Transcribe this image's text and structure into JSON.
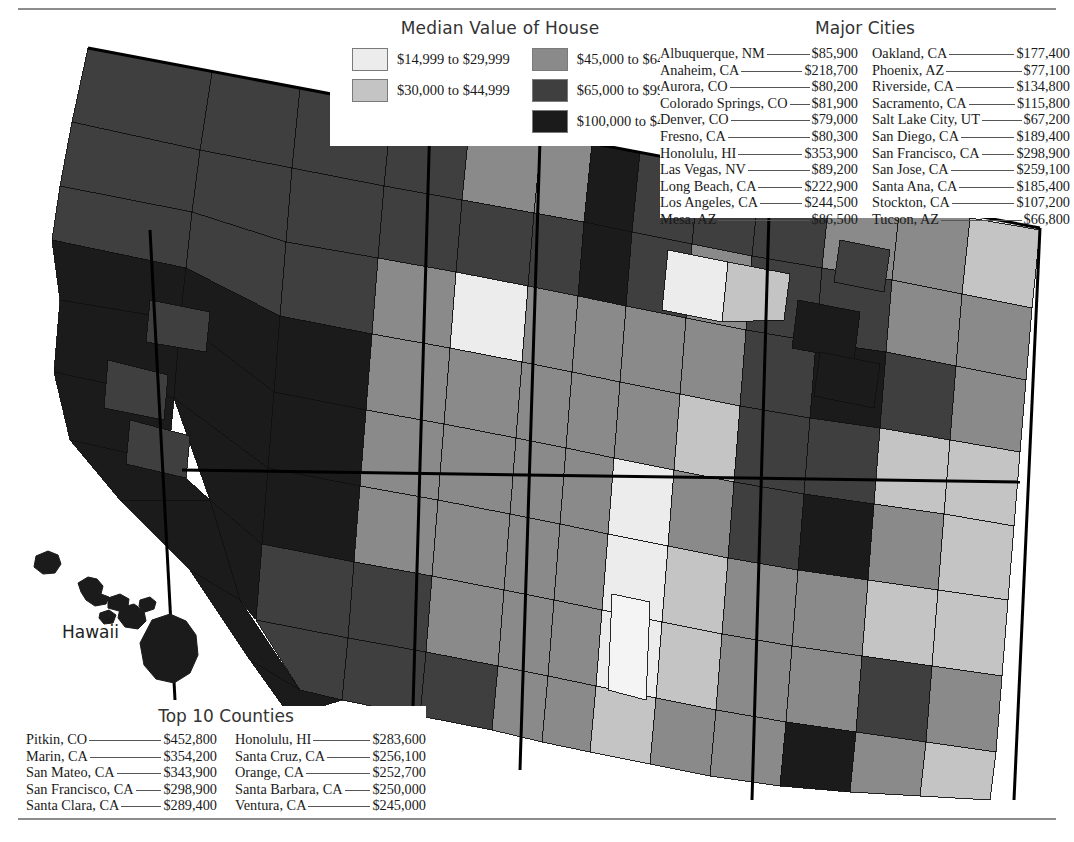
{
  "legend": {
    "title": "Median Value of House",
    "columns": [
      [
        {
          "label": "$14,999 to $29,999",
          "color": "#ececec"
        },
        {
          "label": "$30,000 to $44,999",
          "color": "#c4c4c4"
        }
      ],
      [
        {
          "label": "$45,000 to $64,999",
          "color": "#8a8a8a"
        },
        {
          "label": "$65,000 to $99,999",
          "color": "#3f3f3f"
        },
        {
          "label": "$100,000 to $487,300",
          "color": "#1b1b1b"
        }
      ]
    ]
  },
  "cities": {
    "title": "Major Cities",
    "columns": [
      [
        {
          "name": "Albuquerque, NM",
          "value": "$85,900"
        },
        {
          "name": "Anaheim, CA",
          "value": "$218,700"
        },
        {
          "name": "Aurora, CO",
          "value": "$80,200"
        },
        {
          "name": "Colorado Springs, CO",
          "value": "$81,900"
        },
        {
          "name": "Denver, CO",
          "value": "$79,000"
        },
        {
          "name": "Fresno, CA",
          "value": "$80,300"
        },
        {
          "name": "Honolulu, HI",
          "value": "$353,900"
        },
        {
          "name": "Las Vegas, NV",
          "value": "$89,200"
        },
        {
          "name": "Long Beach, CA",
          "value": "$222,900"
        },
        {
          "name": "Los Angeles, CA",
          "value": "$244,500"
        },
        {
          "name": "Mesa, AZ",
          "value": "$86,500"
        }
      ],
      [
        {
          "name": "Oakland, CA",
          "value": "$177,400"
        },
        {
          "name": "Phoenix, AZ",
          "value": "$77,100"
        },
        {
          "name": "Riverside, CA",
          "value": "$134,800"
        },
        {
          "name": "Sacramento, CA",
          "value": "$115,800"
        },
        {
          "name": "Salt Lake City, UT",
          "value": "$67,200"
        },
        {
          "name": "San Diego, CA",
          "value": "$189,400"
        },
        {
          "name": "San Francisco, CA",
          "value": "$298,900"
        },
        {
          "name": "San Jose, CA",
          "value": "$259,100"
        },
        {
          "name": "Santa Ana, CA",
          "value": "$185,400"
        },
        {
          "name": "Stockton, CA",
          "value": "$107,200"
        },
        {
          "name": "Tucson, AZ",
          "value": "$66,800"
        }
      ]
    ]
  },
  "counties": {
    "title": "Top 10 Counties",
    "columns": [
      [
        {
          "name": "Pitkin, CO",
          "value": "$452,800"
        },
        {
          "name": "Marin, CA",
          "value": "$354,200"
        },
        {
          "name": "San Mateo, CA",
          "value": "$343,900"
        },
        {
          "name": "San Francisco, CA",
          "value": "$298,900"
        },
        {
          "name": "Santa Clara, CA",
          "value": "$289,400"
        }
      ],
      [
        {
          "name": "Honolulu, HI",
          "value": "$283,600"
        },
        {
          "name": "Santa Cruz, CA",
          "value": "$256,100"
        },
        {
          "name": "Orange, CA",
          "value": "$252,700"
        },
        {
          "name": "Santa Barbara, CA",
          "value": "$250,000"
        },
        {
          "name": "Ventura, CA",
          "value": "$245,000"
        }
      ]
    ]
  },
  "map": {
    "hawaii_label": "Hawaii",
    "palette": {
      "c1": "#ececec",
      "c2": "#c4c4c4",
      "c3": "#8a8a8a",
      "c4": "#3f3f3f",
      "c5": "#1b1b1b"
    },
    "stroke": "#111111",
    "state_stroke": "#000000"
  },
  "chart_data": {
    "type": "choropleth-map",
    "title": "Median Value of House",
    "region": "Western United States (counties) with Hawaii inset",
    "legend_position": "top-center",
    "classes": [
      {
        "label": "$14,999 to $29,999",
        "color": "#ececec",
        "min": 14999,
        "max": 29999
      },
      {
        "label": "$30,000 to $44,999",
        "color": "#c4c4c4",
        "min": 30000,
        "max": 44999
      },
      {
        "label": "$45,000 to $64,999",
        "color": "#8a8a8a",
        "min": 45000,
        "max": 64999
      },
      {
        "label": "$65,000 to $99,999",
        "color": "#3f3f3f",
        "min": 65000,
        "max": 99999
      },
      {
        "label": "$100,000 to $487,300",
        "color": "#1b1b1b",
        "min": 100000,
        "max": 487300
      }
    ],
    "annotations": [
      "Hawaii"
    ],
    "tables": [
      {
        "name": "Major Cities",
        "columns": [
          "City",
          "Median Value of House"
        ],
        "rows": [
          [
            "Albuquerque, NM",
            "$85,900"
          ],
          [
            "Anaheim, CA",
            "$218,700"
          ],
          [
            "Aurora, CO",
            "$80,200"
          ],
          [
            "Colorado Springs, CO",
            "$81,900"
          ],
          [
            "Denver, CO",
            "$79,000"
          ],
          [
            "Fresno, CA",
            "$80,300"
          ],
          [
            "Honolulu, HI",
            "$353,900"
          ],
          [
            "Las Vegas, NV",
            "$89,200"
          ],
          [
            "Long Beach, CA",
            "$222,900"
          ],
          [
            "Los Angeles, CA",
            "$244,500"
          ],
          [
            "Mesa, AZ",
            "$86,500"
          ],
          [
            "Oakland, CA",
            "$177,400"
          ],
          [
            "Phoenix, AZ",
            "$77,100"
          ],
          [
            "Riverside, CA",
            "$134,800"
          ],
          [
            "Sacramento, CA",
            "$115,800"
          ],
          [
            "Salt Lake City, UT",
            "$67,200"
          ],
          [
            "San Diego, CA",
            "$189,400"
          ],
          [
            "San Francisco, CA",
            "$298,900"
          ],
          [
            "San Jose, CA",
            "$259,100"
          ],
          [
            "Santa Ana, CA",
            "$185,400"
          ],
          [
            "Stockton, CA",
            "$107,200"
          ],
          [
            "Tucson, AZ",
            "$66,800"
          ]
        ]
      },
      {
        "name": "Top 10 Counties",
        "columns": [
          "County",
          "Median Value of House"
        ],
        "rows": [
          [
            "Pitkin, CO",
            "$452,800"
          ],
          [
            "Marin, CA",
            "$354,200"
          ],
          [
            "San Mateo, CA",
            "$343,900"
          ],
          [
            "San Francisco, CA",
            "$298,900"
          ],
          [
            "Santa Clara, CA",
            "$289,400"
          ],
          [
            "Honolulu, HI",
            "$283,600"
          ],
          [
            "Santa Cruz, CA",
            "$256,100"
          ],
          [
            "Orange, CA",
            "$252,700"
          ],
          [
            "Santa Barbara, CA",
            "$250,000"
          ],
          [
            "Ventura, CA",
            "$245,000"
          ]
        ]
      }
    ]
  }
}
